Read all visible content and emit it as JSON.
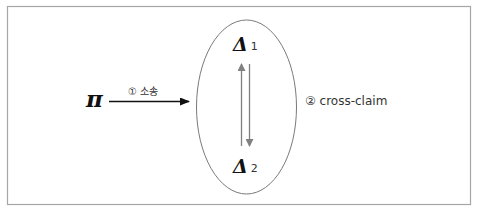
{
  "diagram": {
    "type": "relation-diagram",
    "frame": {
      "border_color": "#a6a6a6"
    },
    "nodes": [
      {
        "id": "pi",
        "symbol": "π"
      },
      {
        "id": "delta1",
        "symbol": "Δ",
        "subscript": "1"
      },
      {
        "id": "delta2",
        "symbol": "Δ",
        "subscript": "2"
      }
    ],
    "group": {
      "shape": "ellipse",
      "members": [
        "delta1",
        "delta2"
      ],
      "stroke_color": "#7a7a7a"
    },
    "edges": [
      {
        "from": "pi",
        "to": "group",
        "label": "① 소송",
        "color": "#111111"
      },
      {
        "from": "delta1",
        "to": "delta2",
        "bidirectional": true,
        "label": "② cross-claim",
        "color": "#808080"
      }
    ]
  },
  "labels": {
    "pi": "π",
    "delta1_symbol": "Δ",
    "delta1_sub": "1",
    "delta2_symbol": "Δ",
    "delta2_sub": "2",
    "edge1": "① 소송",
    "edge2": "② cross-claim"
  }
}
